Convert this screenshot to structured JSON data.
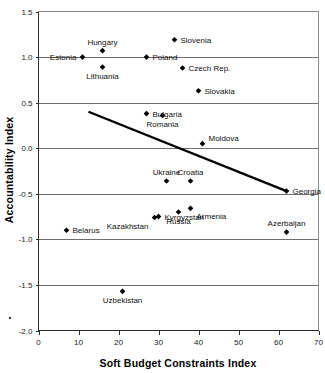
{
  "chart_data": {
    "type": "scatter",
    "title": "",
    "xlabel": "Soft Budget Constraints Index",
    "ylabel": "Accountability Index",
    "xlim": [
      0,
      70
    ],
    "ylim": [
      -2.0,
      1.5
    ],
    "xticks": [
      0,
      10,
      20,
      30,
      40,
      50,
      60,
      70
    ],
    "xtick_labels": [
      "0",
      "10",
      "20",
      "30",
      "40",
      "50",
      "60",
      "70"
    ],
    "yticks": [
      -2.0,
      -1.5,
      -1.0,
      -0.5,
      0.0,
      0.5,
      1.0,
      1.5
    ],
    "ytick_labels": [
      "-2.0",
      "-1.5",
      "-1.0",
      "-0.5",
      "0.0",
      "0.5",
      "1.0",
      "1.5"
    ],
    "grid": "horizontal",
    "legend": "none",
    "marker_color": "#000000",
    "trendline_color": "#000000",
    "points": [
      {
        "label": "Estonia",
        "x": 11,
        "y": 1.0,
        "label_pos": "left"
      },
      {
        "label": "Hungary",
        "x": 16,
        "y": 1.07,
        "label_pos": "above"
      },
      {
        "label": "Poland",
        "x": 27,
        "y": 1.0,
        "label_pos": "right"
      },
      {
        "label": "Lithuania",
        "x": 16,
        "y": 0.89,
        "label_pos": "below"
      },
      {
        "label": "Slovenia",
        "x": 34,
        "y": 1.19,
        "label_pos": "right"
      },
      {
        "label": "Czech Rep.",
        "x": 36,
        "y": 0.88,
        "label_pos": "right"
      },
      {
        "label": "Slovakia",
        "x": 40,
        "y": 0.63,
        "label_pos": "right"
      },
      {
        "label": "Bulgaria",
        "x": 27,
        "y": 0.38,
        "label_pos": "right"
      },
      {
        "label": "Romania",
        "x": 31,
        "y": 0.36,
        "label_pos": "below"
      },
      {
        "label": "Moldova",
        "x": 41,
        "y": 0.05,
        "label_pos": "above-right"
      },
      {
        "label": "Ukraine",
        "x": 32,
        "y": -0.36,
        "label_pos": "above"
      },
      {
        "label": "Croatia",
        "x": 38,
        "y": -0.36,
        "label_pos": "above"
      },
      {
        "label": "Georgia",
        "x": 62,
        "y": -0.47,
        "label_pos": "right"
      },
      {
        "label": "Armenia",
        "x": 38,
        "y": -0.66,
        "label_pos": "below-right"
      },
      {
        "label": "Russia",
        "x": 35,
        "y": -0.7,
        "label_pos": "below"
      },
      {
        "label": "Kyrgyzstan",
        "x": 30,
        "y": -0.75,
        "label_pos": "right"
      },
      {
        "label": "Kazakhstan",
        "x": 29,
        "y": -0.76,
        "label_pos": "below-left"
      },
      {
        "label": "Belarus",
        "x": 7,
        "y": -0.9,
        "label_pos": "right"
      },
      {
        "label": "Azerbaijan",
        "x": 62,
        "y": -0.92,
        "label_pos": "above"
      },
      {
        "label": "Uzbekistan",
        "x": 21,
        "y": -1.57,
        "label_pos": "below"
      }
    ],
    "trendline": {
      "x0": 12.5,
      "y0": 0.4,
      "x1": 62.0,
      "y1": -0.47
    }
  }
}
